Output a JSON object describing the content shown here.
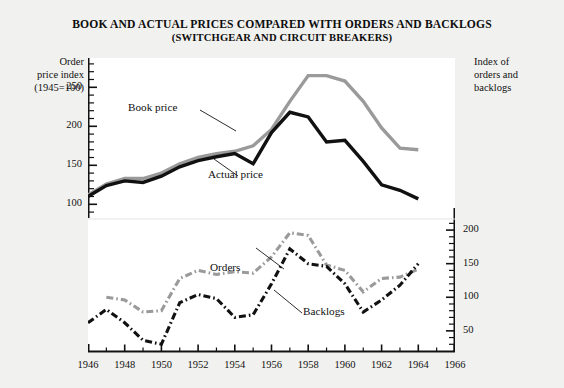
{
  "title": {
    "line1": "BOOK AND ACTUAL PRICES COMPARED WITH ORDERS AND BACKLOGS",
    "line2": "(SWITCHGEAR AND CIRCUIT BREAKERS)"
  },
  "axes": {
    "left_caption": "Order\nprice index\n(1945=100)",
    "left_caption_lines": [
      "Order",
      "price index",
      "(1945=100)"
    ],
    "right_caption_lines": [
      "Index of",
      "orders and",
      "backlogs"
    ]
  },
  "series_labels": {
    "book_price": "Book price",
    "actual_price": "Actual price",
    "orders": "Orders",
    "backlogs": "Backlogs"
  },
  "colors": {
    "background": "#f1f1ef",
    "plot_background": "#ffffff",
    "book_price": "#9a9a9a",
    "actual_price": "#111111",
    "orders": "#9a9a9a",
    "backlogs": "#111111",
    "axis": "#111111"
  },
  "chart_data": {
    "type": "line",
    "title": "BOOK AND ACTUAL PRICES COMPARED WITH ORDERS AND BACKLOGS (SWITCHGEAR AND CIRCUIT BREAKERS)",
    "xlabel": "",
    "ylabel": "Order price index (1945=100)",
    "y2label": "Index of orders and backlogs",
    "xlim": [
      1946,
      1966
    ],
    "xticks": [
      1946,
      1948,
      1950,
      1952,
      1954,
      1956,
      1958,
      1960,
      1962,
      1964,
      1966
    ],
    "xtick_labels": [
      "1946",
      "1948",
      "1950",
      "1952",
      "1954",
      "1956",
      "1958",
      "1960",
      "1962",
      "1964",
      "1966"
    ],
    "minor_x_step": 1,
    "grid": false,
    "legend": "inline-annotations",
    "panels": [
      {
        "name": "upper",
        "ylim": [
          85,
          285
        ],
        "yticks": [
          100,
          150,
          200,
          250
        ],
        "ytick_labels": [
          "100",
          "150",
          "200",
          "250"
        ],
        "minor_y_step": 10,
        "axis_side": "left",
        "series": [
          {
            "name": "Book price",
            "color": "#9a9a9a",
            "style": "solid",
            "x": [
              1946,
              1947,
              1948,
              1949,
              1950,
              1951,
              1952,
              1953,
              1954,
              1955,
              1956,
              1957,
              1958,
              1959,
              1960,
              1961,
              1962,
              1963,
              1964
            ],
            "values": [
              112,
              126,
              133,
              133,
              140,
              152,
              160,
              165,
              168,
              175,
              196,
              232,
              265,
              265,
              258,
              232,
              198,
              172,
              170
            ]
          },
          {
            "name": "Actual price",
            "color": "#111111",
            "style": "solid",
            "x": [
              1946,
              1947,
              1948,
              1949,
              1950,
              1951,
              1952,
              1953,
              1954,
              1955,
              1956,
              1957,
              1958,
              1959,
              1960,
              1961,
              1962,
              1963,
              1964
            ],
            "values": [
              110,
              124,
              130,
              128,
              136,
              148,
              156,
              161,
              165,
              152,
              192,
              218,
              212,
              180,
              182,
              155,
              125,
              118,
              107
            ]
          }
        ]
      },
      {
        "name": "lower",
        "ylim": [
          20,
          215
        ],
        "yticks": [
          50,
          100,
          150,
          200
        ],
        "ytick_labels": [
          "50",
          "100",
          "150",
          "200"
        ],
        "minor_y_step": 10,
        "axis_side": "right",
        "series": [
          {
            "name": "Orders",
            "color": "#9a9a9a",
            "style": "dash-dot",
            "x": [
              1946,
              1947,
              1948,
              1949,
              1950,
              1951,
              1952,
              1953,
              1954,
              1955,
              1956,
              1957,
              1958,
              1959,
              1960,
              1961,
              1962,
              1963,
              1964
            ],
            "values": [
              null,
              100,
              96,
              78,
              80,
              128,
              140,
              134,
              138,
              136,
              160,
              196,
              192,
              148,
              140,
              108,
              128,
              130,
              142
            ]
          },
          {
            "name": "Backlogs",
            "color": "#111111",
            "style": "dash-dot",
            "x": [
              1946,
              1947,
              1948,
              1949,
              1950,
              1951,
              1952,
              1953,
              1954,
              1955,
              1956,
              1957,
              1958,
              1959,
              1960,
              1961,
              1962,
              1963,
              1964
            ],
            "values": [
              62,
              82,
              62,
              36,
              30,
              92,
              104,
              98,
              70,
              74,
              120,
              172,
              150,
              146,
              120,
              78,
              96,
              118,
              150
            ]
          }
        ]
      }
    ]
  }
}
